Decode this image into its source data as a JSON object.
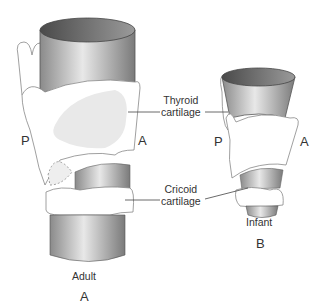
{
  "diagram": {
    "panels": [
      {
        "id": "A",
        "caption": "Adult",
        "letter": "A",
        "posterior": "P",
        "anterior": "A"
      },
      {
        "id": "B",
        "caption": "Infant",
        "letter": "B",
        "posterior": "P",
        "anterior": "A"
      }
    ],
    "labels": {
      "thyroid_line1": "Thyroid",
      "thyroid_line2": "cartilage",
      "cricoid_line1": "Cricoid",
      "cricoid_line2": "cartilage"
    },
    "colors": {
      "tube_dark": "#5a5a5a",
      "tube_light": "#e6e6e6",
      "cartilage_fill": "#ffffff",
      "outline": "#777777",
      "shade": "#e8e8e8"
    }
  }
}
